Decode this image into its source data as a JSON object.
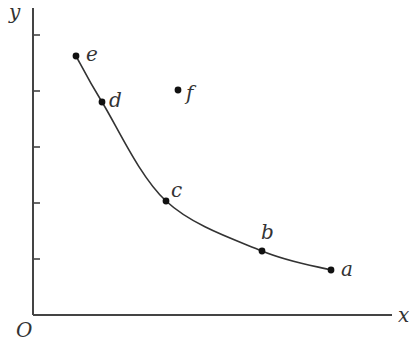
{
  "diagram": {
    "axes": {
      "x_label": "x",
      "y_label": "y",
      "origin_label": "O",
      "origin_px": [
        33,
        315
      ],
      "x_end_px": 392,
      "y_end_px": 8,
      "y_ticks_px": [
        35,
        91,
        147,
        203,
        259
      ]
    },
    "curve_points": [
      "e",
      "d",
      "c",
      "b",
      "a"
    ],
    "points": [
      {
        "id": "e",
        "label": "e",
        "px": [
          76,
          56
        ],
        "label_offset": [
          10,
          5
        ],
        "on_curve": true
      },
      {
        "id": "d",
        "label": "d",
        "px": [
          102,
          102
        ],
        "label_offset": [
          7,
          5
        ],
        "on_curve": true
      },
      {
        "id": "f",
        "label": "f",
        "px": [
          178,
          90
        ],
        "label_offset": [
          8,
          10
        ],
        "on_curve": false
      },
      {
        "id": "c",
        "label": "c",
        "px": [
          166,
          201
        ],
        "label_offset": [
          5,
          -4
        ],
        "on_curve": true
      },
      {
        "id": "b",
        "label": "b",
        "px": [
          262,
          251
        ],
        "label_offset": [
          -1,
          -12
        ],
        "on_curve": true
      },
      {
        "id": "a",
        "label": "a",
        "px": [
          331,
          270
        ],
        "label_offset": [
          10,
          6
        ],
        "on_curve": true
      }
    ],
    "colors": {
      "stroke": "#333333",
      "point": "#111111"
    }
  }
}
